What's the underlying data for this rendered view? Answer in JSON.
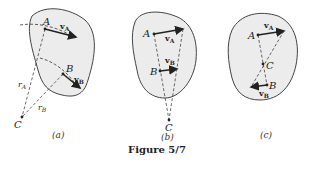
{
  "figure": {
    "title": "Figure 5/7",
    "panels": [
      {
        "caption": "(a)",
        "labels": {
          "A": "A",
          "B": "B",
          "C": "C",
          "vA": "v",
          "vA_sub": "A",
          "vB": "v",
          "vB_sub": "B",
          "rA": "r",
          "rA_sub": "A",
          "rB": "r",
          "rB_sub": "B"
        }
      },
      {
        "caption": "(b)",
        "labels": {
          "A": "A",
          "B": "B",
          "C": "C",
          "vA": "v",
          "vA_sub": "A",
          "vB": "v",
          "vB_sub": "B"
        }
      },
      {
        "caption": "(c)",
        "labels": {
          "A": "A",
          "B": "B",
          "C": "C",
          "vA": "v",
          "vA_sub": "A",
          "vB": "v",
          "vB_sub": "B"
        }
      }
    ]
  }
}
